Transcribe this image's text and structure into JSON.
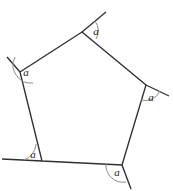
{
  "figure": {
    "kind": "geometry-diagram",
    "shape_name": "pentagon",
    "canvas": {
      "width": 173,
      "height": 191,
      "background": "#ffffff"
    },
    "stroke_color": "#2f2f34",
    "arc_color": "#8b8b92",
    "label_color": "#1d1d20",
    "vertices": [
      {
        "name": "top",
        "x": 82,
        "y": 32
      },
      {
        "name": "right",
        "x": 146,
        "y": 85
      },
      {
        "name": "bottom-right",
        "x": 122,
        "y": 165
      },
      {
        "name": "bottom-left",
        "x": 42,
        "y": 161
      },
      {
        "name": "left",
        "x": 20,
        "y": 72
      }
    ],
    "polygon_path": "M 82 32 L 146 85 L 122 165 L 42 161 L 20 72 Z",
    "extension_rays": [
      {
        "name": "ray-top",
        "x1": 82,
        "y1": 32,
        "x2": 106,
        "y2": 12
      },
      {
        "name": "ray-right",
        "x1": 146,
        "y1": 85,
        "x2": 169,
        "y2": 96
      },
      {
        "name": "ray-bottom-right",
        "x1": 122,
        "y1": 165,
        "x2": 131,
        "y2": 189
      },
      {
        "name": "ray-bottom-left",
        "x1": 42,
        "y1": 161,
        "x2": 2,
        "y2": 159
      },
      {
        "name": "ray-left",
        "x1": 20,
        "y1": 72,
        "x2": 7,
        "y2": 57
      }
    ],
    "angle_marks": [
      {
        "name": "angle-top",
        "label": "a",
        "arc_path": "M 96 39 A 16 16 0 0 0 95 21",
        "label_x": 96,
        "label_y": 32
      },
      {
        "name": "angle-right",
        "label": "a",
        "arc_path": "M 141 100 A 16 16 0 0 0 160 91",
        "label_x": 151,
        "label_y": 98
      },
      {
        "name": "angle-bottom-right",
        "label": "a",
        "arc_path": "M 106 164 A 17 17 0 0 0 126 182",
        "label_x": 117,
        "label_y": 173
      },
      {
        "name": "angle-bottom-left",
        "label": "a",
        "arc_path": "M 24 160 A 18 18 0 0 0 36 144",
        "label_x": 33,
        "label_y": 155
      },
      {
        "name": "angle-left",
        "label": "a",
        "arc_path": "M 15 57 A 18 18 0 0 0 33 83",
        "label_x": 26,
        "label_y": 73
      }
    ]
  }
}
